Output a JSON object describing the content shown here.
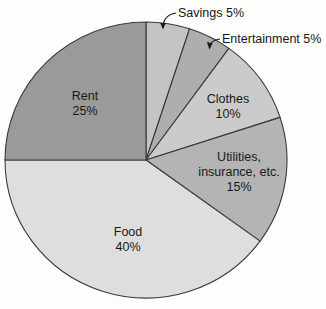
{
  "figure": {
    "background_color": "#fdfdfc",
    "outline_color": "#3a3a3a",
    "text_color": "#191919"
  },
  "chart_data": {
    "type": "pie",
    "title": "",
    "direction": "clockwise",
    "start_angle": "12 o'clock",
    "legend": "none (labels inside slices or as callouts)",
    "slices": [
      {
        "label": "Savings",
        "value": 5,
        "unit": "%",
        "color": "#c4c4c4",
        "label_placement": "outside-callout",
        "display_lines": [
          "Savings 5%"
        ]
      },
      {
        "label": "Entertainment",
        "value": 5,
        "unit": "%",
        "color": "#aeaeae",
        "label_placement": "outside-callout",
        "display_lines": [
          "Entertainment 5%"
        ]
      },
      {
        "label": "Clothes",
        "value": 10,
        "unit": "%",
        "color": "#cbcbcb",
        "label_placement": "inside",
        "display_lines": [
          "Clothes",
          "10%"
        ]
      },
      {
        "label": "Utilities, insurance, etc.",
        "value": 15,
        "unit": "%",
        "color": "#b4b4b4",
        "label_placement": "inside",
        "display_lines": [
          "Utilities,",
          "insurance, etc.",
          "15%"
        ]
      },
      {
        "label": "Food",
        "value": 40,
        "unit": "%",
        "color": "#dedede",
        "label_placement": "inside",
        "display_lines": [
          "Food",
          "40%"
        ]
      },
      {
        "label": "Rent",
        "value": 25,
        "unit": "%",
        "color": "#9a9a9a",
        "label_placement": "inside",
        "display_lines": [
          "Rent",
          "25%"
        ]
      }
    ]
  }
}
